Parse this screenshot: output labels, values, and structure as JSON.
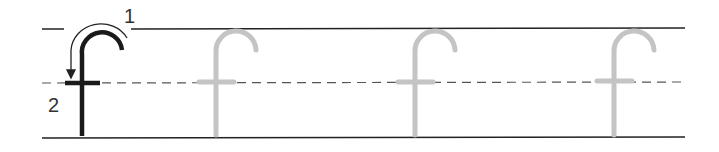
{
  "worksheet": {
    "letter": "f",
    "stroke_labels": [
      "1",
      "2"
    ],
    "model_count": 1,
    "trace_count": 3,
    "colors": {
      "model_letter": "#1a1a1a",
      "trace_letter": "#c4c4c4",
      "guide_lines": "#222222",
      "midline": "#555555"
    }
  }
}
